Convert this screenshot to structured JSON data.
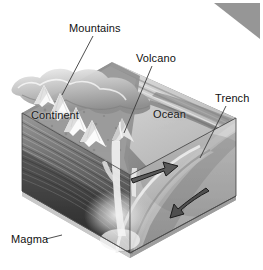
{
  "figure": {
    "kind": "geology-block-diagram",
    "width": 263,
    "height": 270,
    "background_color": "#ffffff"
  },
  "corner_marker": {
    "name": "triangle-marker",
    "shape": "right-triangle",
    "color": "#969696",
    "position": "top-right"
  },
  "labels": {
    "mountains": "Mountains",
    "volcano": "Volcano",
    "trench": "Trench",
    "continent": "Continent",
    "ocean": "Ocean",
    "magma": "Magma"
  },
  "colors": {
    "ink": "#111111",
    "leader_line": "#3a3a3a",
    "block_top_light": "#d6d6d6",
    "block_top_dark": "#8e8e8e",
    "block_front_light": "#b0b0b0",
    "block_front_dark": "#3c3c3c",
    "block_side_light": "#c8c8c8",
    "block_side_dark": "#6a6a6a",
    "ocean_surface": "#cfcfcf",
    "magma_glow": "#f2f2f2",
    "snow": "#fbfbfb",
    "arrow_fill": "#4a4a4a",
    "arrow_stroke": "#1f1f1f",
    "triangle": "#969696"
  },
  "arrows": [
    {
      "name": "plate-convergence-arrow-upper",
      "direction": "up-right",
      "meaning": "overriding plate motion"
    },
    {
      "name": "plate-subduction-arrow-lower",
      "direction": "down-left",
      "meaning": "subducting oceanic plate motion"
    }
  ],
  "leader_lines": [
    {
      "from": "mountains",
      "to": "mountain-range-peak"
    },
    {
      "from": "volcano",
      "to": "volcanic-cone"
    },
    {
      "from": "trench",
      "to": "oceanic-trench"
    },
    {
      "from": "magma",
      "to": "magma-body"
    }
  ]
}
